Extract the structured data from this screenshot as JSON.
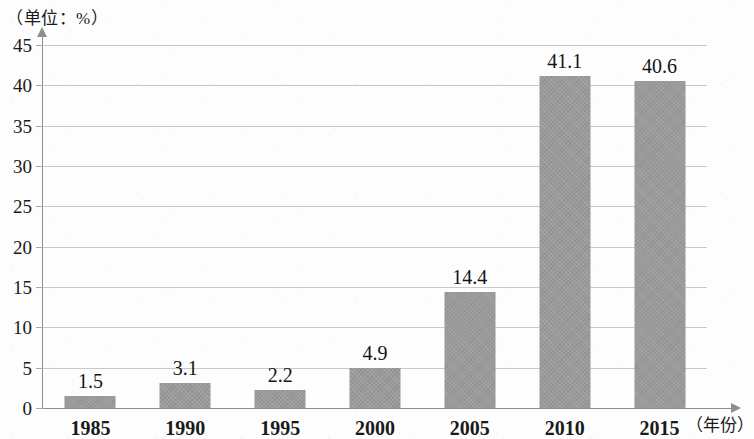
{
  "chart_data": {
    "type": "bar",
    "title": "",
    "subtitle": "",
    "unit_label_y": "（单位：%）",
    "unit_label_x": "（年份）",
    "xlabel": "年份",
    "ylabel": "%",
    "categories": [
      "1985",
      "1990",
      "1995",
      "2000",
      "2005",
      "2010",
      "2015"
    ],
    "values": [
      1.5,
      3.1,
      2.2,
      4.9,
      14.4,
      41.1,
      40.6
    ],
    "value_labels": [
      "1.5",
      "3.1",
      "2.2",
      "4.9",
      "14.4",
      "41.1",
      "40.6"
    ],
    "ylim": [
      0,
      45
    ],
    "ytick_step": 5,
    "ytick_labels": [
      "45",
      "40",
      "35",
      "30",
      "25",
      "20",
      "15",
      "10",
      "5",
      "0"
    ],
    "ytick_values": [
      45,
      40,
      35,
      30,
      25,
      20,
      15,
      10,
      5,
      0
    ],
    "grid": true,
    "grid_axis": "y",
    "legend": false,
    "legend_position": "none",
    "bar_color": "#9a9a9a",
    "grid_color": "#c9c9c9",
    "axis_color": "#8e8e8e",
    "background_color": "#fdfdfd",
    "text_color": "#1a1a1a"
  }
}
